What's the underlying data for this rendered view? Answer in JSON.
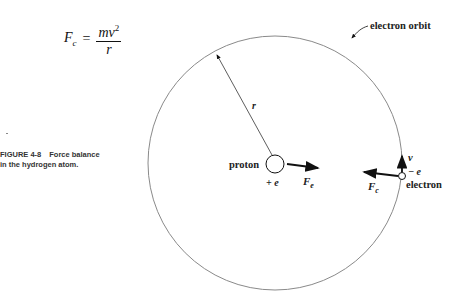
{
  "equation": {
    "lhs": "F",
    "lhs_sub": "c",
    "equals": "=",
    "numerator": "mv",
    "numerator_exp": "2",
    "denominator": "r"
  },
  "caption": {
    "figure_number": "FIGURE 4-8",
    "line1": "Force balance",
    "line2": "in the hydrogen atom."
  },
  "diagram": {
    "orbit_label": "electron orbit",
    "radius_label": "r",
    "proton_label": "proton",
    "proton_charge": "+ e",
    "electric_force_label": "F",
    "electric_force_sub": "e",
    "centripetal_force_label": "F",
    "centripetal_force_sub": "c",
    "velocity_label": "v",
    "electron_charge": "− e",
    "electron_label": "electron",
    "colors": {
      "orbit": "#8a8a8a",
      "ink": "#111111"
    }
  }
}
